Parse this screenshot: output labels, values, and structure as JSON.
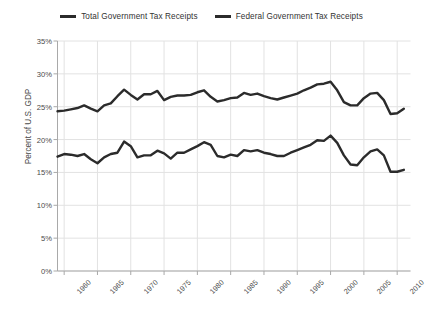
{
  "chart_data": {
    "type": "line",
    "title": "",
    "xlabel": "",
    "ylabel": "Percent of U.S. GDP",
    "xlim": [
      1959,
      2012
    ],
    "ylim": [
      0,
      35
    ],
    "ytick_labels": [
      "0%",
      "5%",
      "10%",
      "15%",
      "20%",
      "25%",
      "30%",
      "35%"
    ],
    "ytick_values": [
      0,
      5,
      10,
      15,
      20,
      25,
      30,
      35
    ],
    "xtick_labels": [
      "1960",
      "1965",
      "1970",
      "1975",
      "1980",
      "1985",
      "1990",
      "1995",
      "2000",
      "2005",
      "2010"
    ],
    "xtick_values": [
      1960,
      1965,
      1970,
      1975,
      1980,
      1985,
      1990,
      1995,
      2000,
      2005,
      2010
    ],
    "grid": true,
    "legend_position": "top-center",
    "line_color": "#2b2b2b",
    "grid_color": "#e2e2e2",
    "axis_color": "#a9a9a9",
    "x": [
      1959,
      1960,
      1961,
      1962,
      1963,
      1964,
      1965,
      1966,
      1967,
      1968,
      1969,
      1970,
      1971,
      1972,
      1973,
      1974,
      1975,
      1976,
      1977,
      1978,
      1979,
      1980,
      1981,
      1982,
      1983,
      1984,
      1985,
      1986,
      1987,
      1988,
      1989,
      1990,
      1991,
      1992,
      1993,
      1994,
      1995,
      1996,
      1997,
      1998,
      1999,
      2000,
      2001,
      2002,
      2003,
      2004,
      2005,
      2006,
      2007,
      2008,
      2009,
      2010,
      2011
    ],
    "series": [
      {
        "name": "Total Government Tax Receipts",
        "color": "#2b2b2b",
        "values": [
          24.3,
          24.4,
          24.6,
          24.8,
          25.2,
          24.7,
          24.3,
          25.2,
          25.5,
          26.6,
          27.6,
          26.8,
          26.1,
          26.9,
          26.9,
          27.4,
          26.0,
          26.5,
          26.7,
          26.7,
          26.8,
          27.2,
          27.5,
          26.5,
          25.8,
          26.0,
          26.3,
          26.4,
          27.1,
          26.8,
          27.0,
          26.6,
          26.3,
          26.1,
          26.4,
          26.7,
          27.0,
          27.5,
          27.9,
          28.4,
          28.5,
          28.8,
          27.5,
          25.7,
          25.2,
          25.2,
          26.3,
          27.0,
          27.1,
          26.0,
          23.9,
          24.0,
          24.7
        ]
      },
      {
        "name": "Federal Government Tax Receipts",
        "color": "#2b2b2b",
        "values": [
          17.4,
          17.8,
          17.7,
          17.5,
          17.8,
          17.0,
          16.4,
          17.3,
          17.8,
          18.0,
          19.7,
          19.0,
          17.3,
          17.6,
          17.6,
          18.3,
          17.9,
          17.1,
          18.0,
          18.0,
          18.5,
          19.0,
          19.6,
          19.2,
          17.5,
          17.3,
          17.7,
          17.5,
          18.4,
          18.2,
          18.4,
          18.0,
          17.8,
          17.5,
          17.5,
          18.0,
          18.4,
          18.8,
          19.2,
          19.9,
          19.8,
          20.6,
          19.5,
          17.6,
          16.2,
          16.1,
          17.3,
          18.2,
          18.5,
          17.6,
          15.1,
          15.1,
          15.4
        ]
      }
    ]
  },
  "legend": {
    "items": [
      {
        "label": "Total Government Tax Receipts",
        "swatch_name": "legend-swatch-total"
      },
      {
        "label": "Federal Government Tax Receipts",
        "swatch_name": "legend-swatch-federal"
      }
    ]
  },
  "axes": {
    "y_axis_title": "Percent of U.S. GDP"
  }
}
